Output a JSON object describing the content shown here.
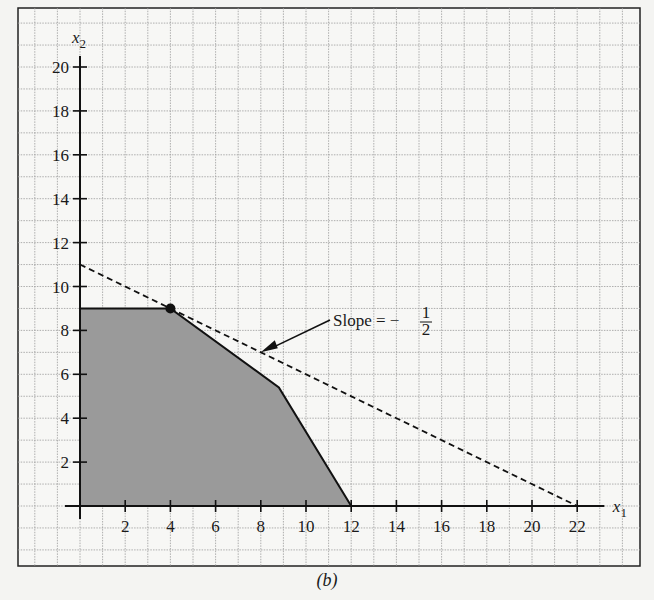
{
  "chart_data": {
    "type": "area",
    "title": "",
    "caption": "(b)",
    "xlabel": "x1",
    "ylabel": "x2",
    "xlim": [
      0,
      22
    ],
    "ylim": [
      0,
      20
    ],
    "grid": true,
    "x_ticks": [
      2,
      4,
      6,
      8,
      10,
      12,
      14,
      16,
      18,
      20,
      22
    ],
    "y_ticks": [
      2,
      4,
      6,
      8,
      10,
      12,
      14,
      16,
      18,
      20
    ],
    "feasible_region": {
      "name": "feasible region",
      "vertices": [
        [
          0,
          0
        ],
        [
          0,
          9
        ],
        [
          4,
          9
        ],
        [
          8.8,
          5.4
        ],
        [
          12,
          0
        ]
      ],
      "fill": "#9a9a9a"
    },
    "objective_line": {
      "name": "iso-objective line",
      "style": "dashed",
      "points": [
        [
          0,
          11
        ],
        [
          22,
          0
        ]
      ],
      "slope": -0.5
    },
    "optimal_point": {
      "x": 4,
      "y": 9
    },
    "annotation": {
      "text": "Slope = −",
      "fraction_numerator": "1",
      "fraction_denominator": "2",
      "arrow_target": [
        8,
        7
      ]
    },
    "legend": null
  },
  "labels": {
    "x_axis": "x",
    "x_axis_sub": "1",
    "y_axis": "x",
    "y_axis_sub": "2",
    "caption": "(b)"
  }
}
